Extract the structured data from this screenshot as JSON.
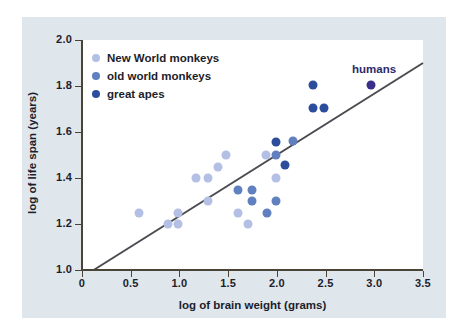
{
  "chart_data": {
    "type": "scatter",
    "title": "",
    "xlabel": "log of brain weight (grams)",
    "ylabel": "log of life span (years)",
    "xlim": [
      0,
      3.5
    ],
    "ylim": [
      1.0,
      2.0
    ],
    "xticks": [
      "0",
      "0.5",
      "1.0",
      "1.5",
      "2.0",
      "2.5",
      "3.0",
      "3.5"
    ],
    "xtick_values": [
      0,
      0.5,
      1.0,
      1.5,
      2.0,
      2.5,
      3.0,
      3.5
    ],
    "yticks": [
      "1.0",
      "1.2",
      "1.4",
      "1.6",
      "1.8",
      "2.0"
    ],
    "ytick_values": [
      1.0,
      1.2,
      1.4,
      1.6,
      1.8,
      2.0
    ],
    "grid": false,
    "legend_position": "top-left",
    "series": [
      {
        "name": "New World monkeys",
        "color": "#b3bfe4",
        "points": [
          [
            0.58,
            1.25
          ],
          [
            0.88,
            1.2
          ],
          [
            0.99,
            1.2
          ],
          [
            0.99,
            1.25
          ],
          [
            1.17,
            1.4
          ],
          [
            1.29,
            1.4
          ],
          [
            1.29,
            1.3
          ],
          [
            1.4,
            1.45
          ],
          [
            1.48,
            1.5
          ],
          [
            1.6,
            1.25
          ],
          [
            1.7,
            1.2
          ],
          [
            1.89,
            1.5
          ],
          [
            1.99,
            1.4
          ]
        ]
      },
      {
        "name": "old world monkeys",
        "color": "#6080c0",
        "points": [
          [
            1.6,
            1.35
          ],
          [
            1.74,
            1.35
          ],
          [
            1.74,
            1.3
          ],
          [
            1.9,
            1.25
          ],
          [
            1.99,
            1.3
          ],
          [
            1.99,
            1.5
          ],
          [
            2.17,
            1.56
          ]
        ]
      },
      {
        "name": "great apes",
        "color": "#2b4d9c",
        "points": [
          [
            1.99,
            1.555
          ],
          [
            2.08,
            1.455
          ],
          [
            2.37,
            1.805
          ],
          [
            2.37,
            1.705
          ],
          [
            2.48,
            1.705
          ]
        ]
      },
      {
        "name": "humans",
        "color": "#3b2f8c",
        "points": [
          [
            2.97,
            1.805
          ]
        ]
      }
    ],
    "annotations": [
      {
        "text": "humans",
        "x": 2.97,
        "y": 1.85,
        "color": "#2c2a6b"
      }
    ],
    "trend_line": {
      "color": "#4a4a50",
      "x_start": 0.12,
      "y_start": 1.0,
      "x_end": 3.5,
      "y_end": 1.9
    }
  },
  "legend": {
    "items": [
      {
        "label": "New World monkeys",
        "color": "#b3bfe4"
      },
      {
        "label": "old world monkeys",
        "color": "#6080c0"
      },
      {
        "label": "great apes",
        "color": "#2b4d9c"
      }
    ]
  },
  "axes": {
    "x_title": "log of brain weight (grams)",
    "y_title": "log of life span (years)"
  }
}
